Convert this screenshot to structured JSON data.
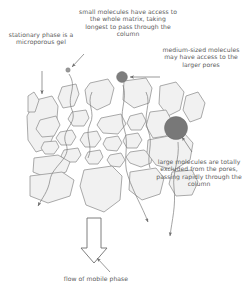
{
  "diagram": {
    "labels": {
      "stationary_phase": "stationary phase is a microporous gel",
      "small_molecules": "small molecules have access to the whole matrix, taking longest to pass through the column",
      "medium_molecules": "medium-sized molecules may have access to the larger pores",
      "large_molecules": "large molecules are totally excluded from the pores, passing rapidly through the column",
      "flow_of_mobile_phase": "flow of mobile phase"
    },
    "molecules": [
      {
        "name": "small-molecule",
        "size_px": 4,
        "cx": 68,
        "cy": 70,
        "color": "#9a9a9a"
      },
      {
        "name": "medium-molecule",
        "size_px": 11,
        "cx": 122,
        "cy": 77,
        "color": "#7e7e7e"
      },
      {
        "name": "large-molecule",
        "size_px": 23,
        "cx": 176,
        "cy": 128,
        "color": "#787878"
      }
    ],
    "colors": {
      "gel_fill": "#f1f1f1",
      "gel_stroke": "#8f8f8f",
      "text": "#5a5a5a",
      "arrow": "#6f6f6f",
      "background": "#ffffff"
    }
  }
}
